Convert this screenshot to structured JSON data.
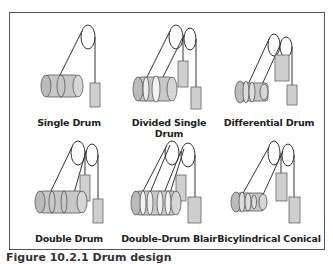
{
  "figure": {
    "caption": "Figure 10.2.1 Drum design",
    "colors": {
      "border": "#555555",
      "drum_fill": "#c8c8c8",
      "weight_fill": "#cfcfcf",
      "stroke": "#333333",
      "label": "#222222"
    },
    "panels": [
      {
        "label": "Single Drum",
        "row": 0,
        "col": 0
      },
      {
        "label": "Divided Single Drum",
        "row": 0,
        "col": 1
      },
      {
        "label": "Differential Drum",
        "row": 0,
        "col": 2
      },
      {
        "label": "Double Drum",
        "row": 1,
        "col": 0
      },
      {
        "label": "Double-Drum Blair",
        "row": 1,
        "col": 1
      },
      {
        "label": "Bicylindrical Conical",
        "row": 1,
        "col": 2
      }
    ]
  }
}
